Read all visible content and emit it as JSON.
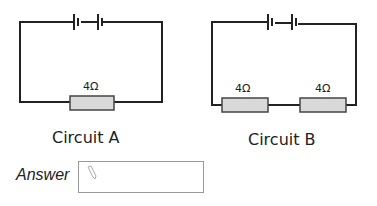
{
  "circuit_a": {
    "label": "Circuit A",
    "resistors": [
      {
        "value": "4Ω"
      }
    ]
  },
  "circuit_b": {
    "label": "Circuit B",
    "resistors": [
      {
        "value": "4Ω"
      },
      {
        "value": "4Ω"
      }
    ]
  },
  "answer": {
    "label": "Answer",
    "value": "",
    "icon": "pencil-icon"
  },
  "colors": {
    "wire": "#222222",
    "resistor_fill": "#d9d9d9",
    "box_border": "#999999"
  }
}
